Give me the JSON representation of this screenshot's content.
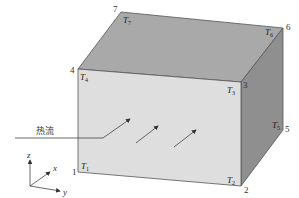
{
  "figure": {
    "colors": {
      "front_face": "#dedede",
      "top_face": "#a9a9a9",
      "right_face": "#8f8f8f",
      "edge": "#555555",
      "arrow": "#444444"
    },
    "vertex_numbers": {
      "v1": "1",
      "v2": "2",
      "v3": "3",
      "v4": "4",
      "v5": "5",
      "v6": "6",
      "v7": "7"
    },
    "temperature_labels": {
      "t1": {
        "main": "T",
        "sub": "1"
      },
      "t2": {
        "main": "T",
        "sub": "2"
      },
      "t3": {
        "main": "T",
        "sub": "3"
      },
      "t4": {
        "main": "T",
        "sub": "4"
      },
      "t5": {
        "main": "T",
        "sub": "5"
      },
      "t6": {
        "main": "T",
        "sub": "6"
      },
      "t7": {
        "main": "T",
        "sub": "7"
      }
    },
    "heat_flow_label": "热流",
    "axes": {
      "z": "z",
      "x": "x",
      "y": "y"
    }
  }
}
